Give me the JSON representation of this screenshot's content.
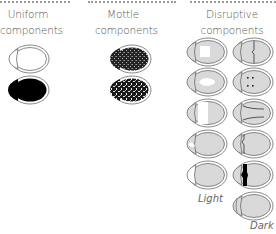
{
  "columns": [
    {
      "id": "uniform",
      "title_line1": "Uniform",
      "title_line2": "components"
    },
    {
      "id": "mottle",
      "title_line1": "Mottle",
      "title_line2": "components"
    },
    {
      "id": "disruptive",
      "title_line1": "Disruptive",
      "title_line2": "components"
    }
  ],
  "disruptive_labels": {
    "light": "Light",
    "dark": "Dark"
  },
  "colors": {
    "outline": "#6b6b6b",
    "fill_light": "#d9d9d9",
    "dark": "#000000",
    "dots": "#9a9a9a"
  },
  "beetles": {
    "uniform": [
      "outline-white",
      "solid-black"
    ],
    "mottle": [
      "mottle-dark",
      "mottle-speckled"
    ],
    "disruptive_left": [
      "square-patch",
      "teardrop-patch",
      "band-patch",
      "head-notch-light",
      "head-notch-white"
    ],
    "disruptive_right": [
      "vertical-line",
      "four-dots",
      "radial-lines",
      "head-shade",
      "black-band",
      "dark-plain"
    ]
  }
}
